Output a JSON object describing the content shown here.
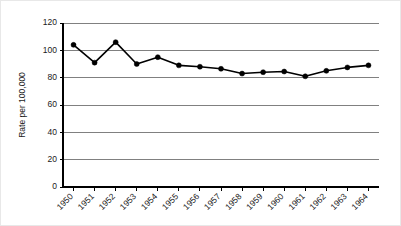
{
  "chart_data": {
    "type": "line",
    "title": "",
    "xlabel": "",
    "ylabel": "Rate per 100,000",
    "categories": [
      "1950",
      "1951",
      "1952",
      "1953",
      "1954",
      "1955",
      "1956",
      "1957",
      "1958",
      "1959",
      "1960",
      "1961",
      "1962",
      "1963",
      "1964"
    ],
    "values": [
      104,
      91,
      106,
      90,
      95,
      89,
      88,
      86.5,
      83,
      84,
      84.5,
      81,
      85,
      87.5,
      89
    ],
    "series": [
      {
        "name": "Rate per 100,000",
        "values": [
          104,
          91,
          106,
          90,
          95,
          89,
          88,
          86.5,
          83,
          84,
          84.5,
          81,
          85,
          87.5,
          89
        ]
      }
    ],
    "ylim": [
      0,
      120
    ],
    "yticks": [
      0,
      20,
      40,
      60,
      80,
      100,
      120
    ],
    "ytick_labels": [
      "0",
      "20",
      "40",
      "60",
      "80",
      "100",
      "120"
    ],
    "xtick_labels": [
      "1950",
      "1951",
      "1952",
      "1953",
      "1954",
      "1955",
      "1956",
      "1957",
      "1958",
      "1959",
      "1960",
      "1961",
      "1962",
      "1963",
      "1964"
    ],
    "grid": "horizontal",
    "legend": "none",
    "marker": "filled-circle",
    "line_color": "#000000",
    "grid_color": "#808080",
    "axis_color": "#000000",
    "background_color": "#ffffff",
    "xtick_label_rotation": -45
  },
  "figure": {
    "background_color": "#ffffff",
    "border_color": "#e8e8e8"
  }
}
